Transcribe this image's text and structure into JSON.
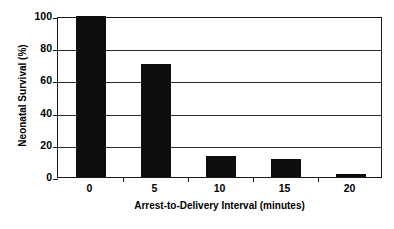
{
  "chart_data": {
    "type": "bar",
    "title": "",
    "subtitle": "",
    "xlabel": "Arrest-to-Delivery Interval (minutes)",
    "ylabel": "Neonatal Survival (%)",
    "categories": [
      "0",
      "5",
      "10",
      "15",
      "20"
    ],
    "values": [
      100,
      70,
      13,
      11.5,
      2
    ],
    "series": [
      {
        "name": "Neonatal Survival",
        "values": [
          100,
          70,
          13,
          11.5,
          2
        ],
        "color": "#0d0d0d"
      }
    ],
    "ylim": [
      0,
      100
    ],
    "y_ticks": [
      0,
      20,
      40,
      60,
      80,
      100
    ],
    "y_tick_labels": [
      "0",
      "20",
      "40",
      "60",
      "80",
      "100"
    ],
    "x_tick_labels": [
      "0",
      "5",
      "10",
      "15",
      "20"
    ],
    "grid": "horizontal",
    "legend": "none",
    "bar_color": "#0d0d0d",
    "plot_background": "#ffffff",
    "frame_color": "#1a1a1a",
    "annotations": []
  }
}
